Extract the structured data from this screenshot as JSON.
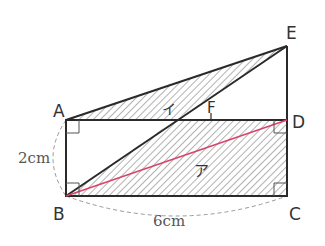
{
  "diagram": {
    "type": "geometry",
    "points": {
      "A": {
        "label": "A"
      },
      "B": {
        "label": "B"
      },
      "C": {
        "label": "C"
      },
      "D": {
        "label": "D"
      },
      "E": {
        "label": "E"
      },
      "F": {
        "label": "F"
      }
    },
    "regions": {
      "a": {
        "label": "ア"
      },
      "i": {
        "label": "イ"
      }
    },
    "measurements": {
      "AB": "2cm",
      "BC": "6cm"
    },
    "colors": {
      "line": "#2a2a2a",
      "hatch": "#555555",
      "diagonal": "#d9436a",
      "dashed": "#888888"
    }
  }
}
